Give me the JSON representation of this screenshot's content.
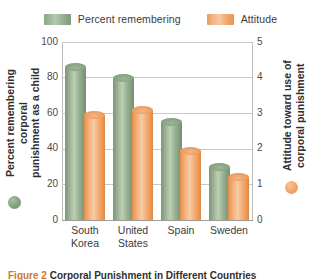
{
  "chart_data": {
    "type": "bar",
    "title": "",
    "categories": [
      "South Korea",
      "United States",
      "Spain",
      "Sweden"
    ],
    "series": [
      {
        "name": "Percent remembering",
        "axis": "left",
        "color": "#8aa684",
        "values": [
          86,
          80,
          55,
          30
        ]
      },
      {
        "name": "Attitude",
        "axis": "right",
        "color": "#eb9b5c",
        "values": [
          59,
          62,
          39,
          24
        ]
      }
    ],
    "left_axis": {
      "label": "Percent remembering corporal punishment as a child",
      "ticks": [
        0,
        20,
        40,
        60,
        80,
        100
      ],
      "ylim": [
        0,
        100
      ]
    },
    "right_axis": {
      "label": "Attitude toward use of corporal punishment",
      "ticks": [
        0,
        1,
        2,
        3,
        4,
        5
      ],
      "ylim": [
        0,
        5
      ]
    },
    "grid": true,
    "legend_position": "top"
  },
  "legend": {
    "entries": [
      {
        "label": "Percent remembering",
        "swatch": "green"
      },
      {
        "label": "Attitude",
        "swatch": "orange"
      }
    ]
  },
  "axes": {
    "left_title": "Percent remembering corporal\npunishment as a child",
    "right_title": "Attitude toward use of\ncorporal punishment",
    "left_ticks": [
      "100",
      "80",
      "60",
      "40",
      "20",
      "0"
    ],
    "right_ticks": [
      "5",
      "4",
      "3",
      "2",
      "1",
      "0"
    ]
  },
  "categories": [
    {
      "label": "South\nKorea"
    },
    {
      "label": "United\nStates"
    },
    {
      "label": "Spain"
    },
    {
      "label": "Sweden"
    }
  ],
  "caption": {
    "figure_number": "Figure 2",
    "text": "Corporal Punishment in Different Countries"
  },
  "colors": {
    "green": "#8aa684",
    "orange": "#eb9b5c",
    "gridline": "#c9c9c9",
    "text": "#3b3b3b"
  }
}
